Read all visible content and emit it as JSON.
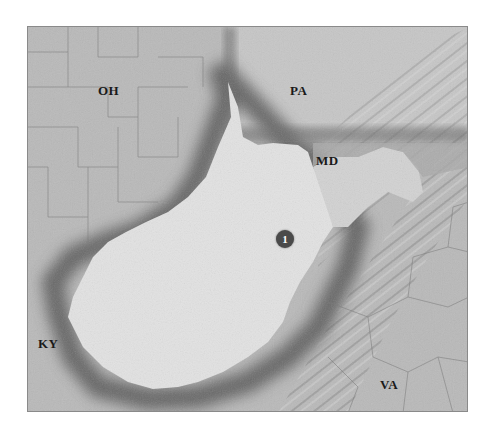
{
  "map": {
    "type": "shaded-relief",
    "colors": {
      "background": "#b9b9b9",
      "focus_state": "#e4e4e4",
      "shadow": "#5e5e5e",
      "label": "#1a1a1a",
      "marker": "#4a4a4a"
    },
    "labels": {
      "oh": "OH",
      "pa": "PA",
      "md": "MD",
      "ky": "KY",
      "va": "VA"
    },
    "marker": {
      "text": "1"
    }
  }
}
